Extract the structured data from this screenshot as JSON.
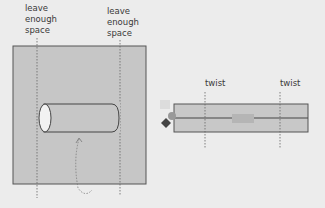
{
  "left_panel": {
    "label_left": [
      "leave",
      "enough",
      "space"
    ],
    "label_right": [
      "leave",
      "enough",
      "space"
    ]
  },
  "right_panel": {
    "label_left": "twist",
    "label_right": "twist"
  },
  "colors": {
    "background": "#ececec",
    "panel_fill": "#c8c8c8",
    "outline": "#555555",
    "marker": "#444444"
  }
}
